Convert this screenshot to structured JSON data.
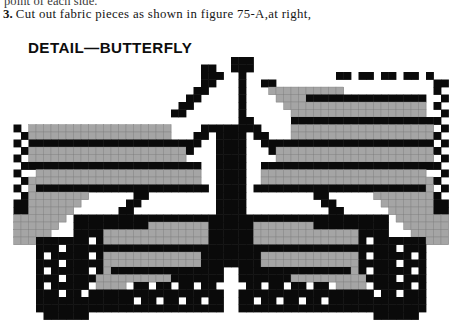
{
  "page": {
    "background_color": "#ffffff",
    "clipped_line_above": "point of each side.",
    "instruction": {
      "number": "3.",
      "text": "Cut out fabric pieces as shown in figure 75-A,at right,"
    },
    "detail_heading": "DETAIL—BUTTERFLY"
  },
  "chart_data": {
    "type": "heatmap",
    "title": "DETAIL—BUTTERFLY",
    "subtitle": "",
    "xlabel": "",
    "ylabel": "",
    "legend": [
      {
        "label": "black",
        "color": "#0a0a0a",
        "code": 2
      },
      {
        "label": "gray",
        "color": "#a5a5a5",
        "code": 1
      },
      {
        "label": "white",
        "color": "#ffffff",
        "code": 0
      }
    ],
    "grid": true,
    "cell_size_px": 7.5,
    "origin_x_px": 6,
    "origin_y_px": 57,
    "cols": 60,
    "rows": 37,
    "colors": {
      "0": "#ffffff",
      "1": "#a5a5a5",
      "2": "#0a0a0a"
    },
    "rows_data": [
      "000000000000000000000000000000002000000000000000000000000000",
      "000000000000000000000000000000002000000000000000000000000000",
      "000000000000000000000000000020002000000000000000000000000000",
      "000000000000000000000000000002002000000000000022222222222000",
      "000000000000000000000000000000200200000000002211111122211200",
      "000000000000000000000000000000020200000000221111112221112200",
      "000000000000000000000000000000002200000022211111222211112200",
      "000000000000000000000000000000002200002221111122221111122200",
      "000000000000000000000000000000002220022111112222111112222000",
      "000000000000000000000000000000002222221111222211111222202000",
      "000000000000000000000000000000222211112222111112222020020000",
      "000000000000000000000000000022211111222211111222202002000000",
      "000000000000000000000000002221111222211111222220200200000000",
      "000000000000000000000000222111122221111122222020020000000000",
      "000000000000000000000022211112222111112222202002000000000000",
      "000000000000000000002221111222211111222220200200000000000000",
      "000000000000000000222111122221111122222020020000000000000000",
      "000000000000000022211112222111112222202002000000000000000000",
      "000000000000002221111222211111222220200200000000000000000000",
      "000000000000222111122221111122222020020000000000000000000000",
      "000000000022211112222111112222202002000000000000000000000000",
      "000000002221111222211111222220200200000000000000000000000000",
      "000000022211122221111122222020020000000000000000000000000000",
      "000000221112222111112222202002000000000000000000000000000000",
      "000002211122221111122220200200000000000000000000000000000000",
      "000022111222211111222202002000000000000000000000000000000000",
      "000221112222111112222020020000000000000000000000000000000000",
      "002211122221111122220200200000000000000000000000000000000000",
      "022111222211111222202002000000000000000000000000000000000000",
      "221112222111112222020020000000000000000000000000000000000000",
      "211122221111122220200200000000000000000000000000000000000000",
      "111222211111222202002000000000000000000000000000000000000000",
      "112222111112222020020000000000000000000000000000000000000000",
      "122221111122220200200000000000000000000000000000000000000000",
      "222211111222202002000000000000000000000000000000000000000000",
      "222111112222020020000000000000000000000000000000000000000000",
      "221111222202002000000000000000000000000000000000000000000000"
    ]
  }
}
